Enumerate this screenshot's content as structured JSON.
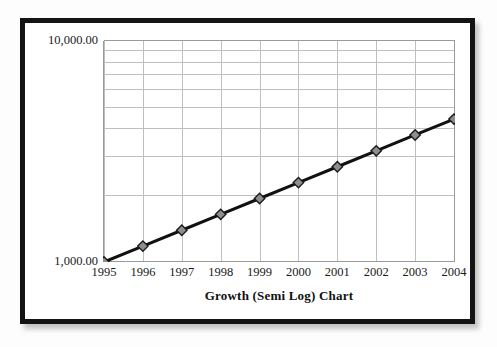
{
  "chart_data": {
    "type": "line",
    "title": "Growth (Semi Log) Chart",
    "xlabel": "",
    "ylabel": "",
    "scale": {
      "x": "linear",
      "y": "log"
    },
    "grid": true,
    "legend": false,
    "categories": [
      "1995",
      "1996",
      "1997",
      "1998",
      "1999",
      "2000",
      "2001",
      "2002",
      "2003",
      "2004"
    ],
    "x": [
      1995,
      1996,
      1997,
      1998,
      1999,
      2000,
      2001,
      2002,
      2003,
      2004
    ],
    "values": [
      1000,
      1179,
      1390,
      1639,
      1932,
      2278,
      2686,
      3167,
      3734,
      4402
    ],
    "ylim": [
      1000,
      10000
    ],
    "ytick_labels": [
      "10,000.00",
      "1,000.00"
    ],
    "ytick_values": [
      10000,
      1000
    ],
    "minor_gridlines": [
      2000,
      3000,
      4000,
      5000,
      6000,
      7000,
      8000,
      9000
    ],
    "series": [
      {
        "name": "Growth",
        "values": [
          1000,
          1179,
          1390,
          1639,
          1932,
          2278,
          2686,
          3167,
          3734,
          4402
        ],
        "line_color": "#111111",
        "marker": "diamond",
        "marker_face_color": "#8e8e8e",
        "marker_edge_color": "#1a1a1a"
      }
    ],
    "colors": {
      "grid": "#bfbfbf",
      "axis": "#9a9a9a",
      "text": "#1a1a1a",
      "plot_background": "#ffffff",
      "frame": "#141414"
    }
  },
  "axis": {
    "y_top_label": "10,000.00",
    "y_bottom_label": "1,000.00"
  }
}
